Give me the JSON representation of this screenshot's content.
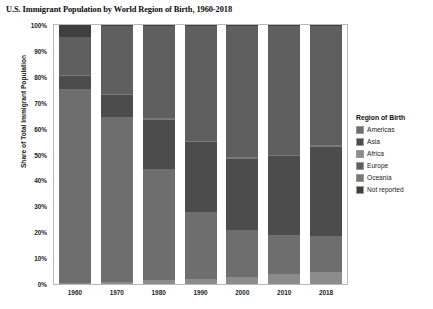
{
  "chart_data": {
    "type": "bar",
    "stacked": true,
    "title": "U.S. Immigrant Population by World Region of Birth, 1960-2018",
    "xlabel": "",
    "ylabel": "Share of Total Immigrant Population",
    "ylim": [
      0,
      100
    ],
    "y_unit": "%",
    "grid": false,
    "legend_position": "right",
    "legend_title": "Region of Birth",
    "categories": [
      "1960",
      "1970",
      "1980",
      "1990",
      "2000",
      "2010",
      "2018"
    ],
    "ytick_labels": [
      "100%",
      "90%",
      "80%",
      "70%",
      "60%",
      "50%",
      "40%",
      "30%",
      "20%",
      "10%",
      "0%"
    ],
    "ytick_values": [
      100,
      90,
      80,
      70,
      60,
      50,
      40,
      30,
      20,
      10,
      0
    ],
    "series": [
      {
        "name": "Americas",
        "color": "#6e6e6e",
        "values": [
          75.0,
          63.5,
          43.0,
          26.0,
          18.0,
          15.0,
          14.0
        ]
      },
      {
        "name": "Asia",
        "color": "#4c4c4c",
        "values": [
          5.0,
          8.5,
          19.0,
          27.0,
          27.5,
          30.5,
          34.5
        ]
      },
      {
        "name": "Africa",
        "color": "#8c8c8c",
        "values": [
          0.4,
          0.9,
          1.5,
          1.8,
          2.8,
          3.9,
          4.5
        ]
      },
      {
        "name": "Europe",
        "color": "#5f5f5f",
        "values": [
          14.6,
          26.1,
          35.5,
          44.2,
          50.7,
          49.6,
          46.0
        ]
      },
      {
        "name": "Oceania",
        "color": "#787878",
        "values": [
          0.4,
          0.5,
          0.6,
          0.6,
          0.6,
          0.6,
          0.6
        ]
      },
      {
        "name": "Not reported",
        "color": "#3f3f3f",
        "values": [
          4.6,
          0.5,
          0.4,
          0.4,
          0.4,
          0.4,
          0.4
        ]
      }
    ],
    "stack_order_bottom_to_top": [
      "Africa",
      "Americas",
      "Asia",
      "Oceania",
      "Europe",
      "Not reported"
    ]
  },
  "legend": {
    "title": "Region of Birth",
    "items": [
      {
        "label": "Americas",
        "color": "#6e6e6e"
      },
      {
        "label": "Asia",
        "color": "#4c4c4c"
      },
      {
        "label": "Africa",
        "color": "#8c8c8c"
      },
      {
        "label": "Europe",
        "color": "#5f5f5f"
      },
      {
        "label": "Oceania",
        "color": "#787878"
      },
      {
        "label": "Not reported",
        "color": "#3f3f3f"
      }
    ]
  }
}
